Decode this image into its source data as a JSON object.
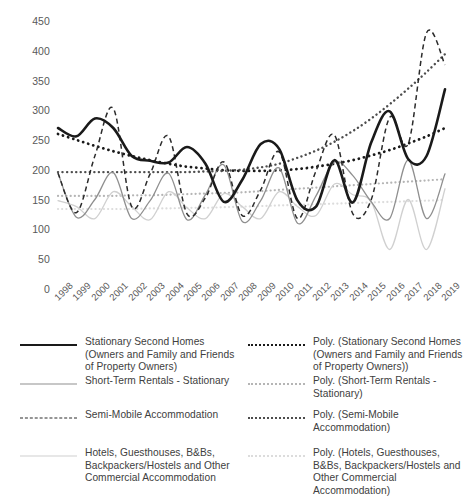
{
  "chart_data": {
    "type": "line",
    "title": "",
    "xlabel": "",
    "ylabel": "",
    "ylim": [
      0,
      450
    ],
    "ytick_step": 50,
    "yticks": [
      "450",
      "400",
      "350",
      "300",
      "250",
      "200",
      "150",
      "100",
      "50",
      "0"
    ],
    "grid": false,
    "legend_position": "bottom",
    "categories": [
      "1998",
      "1999",
      "2000",
      "2001",
      "2002",
      "2003",
      "2004",
      "2005",
      "2006",
      "2007",
      "2008",
      "2009",
      "2010",
      "2011",
      "2012",
      "2013",
      "2014",
      "2015",
      "2016",
      "2017",
      "2018",
      "2019"
    ],
    "series": [
      {
        "name": "Stationary Second Homes (Owners and Family and Friends of Property Owners)",
        "style": "solid",
        "color": "#1a1a1a",
        "width": 2.6,
        "values": [
          272,
          258,
          288,
          272,
          225,
          217,
          214,
          240,
          212,
          148,
          185,
          245,
          237,
          150,
          140,
          218,
          147,
          248,
          300,
          220,
          225,
          337
        ]
      },
      {
        "name": "Short-Term Rentals - Stationary",
        "style": "solid",
        "color": "#8f8f8f",
        "width": 1.3,
        "values": [
          196,
          122,
          152,
          197,
          120,
          150,
          196,
          118,
          160,
          210,
          115,
          150,
          205,
          112,
          158,
          215,
          192,
          148,
          120,
          218,
          120,
          195
        ]
      },
      {
        "name": "Semi-Mobile Accommodation",
        "style": "dashed",
        "color": "#2b2b2b",
        "width": 1.5,
        "values": [
          196,
          130,
          225,
          305,
          140,
          195,
          258,
          128,
          155,
          215,
          125,
          168,
          232,
          120,
          200,
          260,
          128,
          152,
          290,
          245,
          432,
          378
        ]
      },
      {
        "name": "Hotels, Guesthouses, B&Bs, Backpackers/Hostels and Other Commercial Accommodation",
        "style": "solid",
        "color": "#d0d0d0",
        "width": 1.3,
        "values": [
          150,
          140,
          120,
          165,
          140,
          118,
          165,
          138,
          120,
          162,
          140,
          120,
          165,
          140,
          125,
          178,
          160,
          148,
          68,
          152,
          68,
          170
        ]
      }
    ],
    "trendlines": [
      {
        "name": "Poly. (Stationary Second Homes (Owners and Family and Friends of Property Owners))",
        "style": "dotted",
        "color": "#1a1a1a",
        "width": 2.8,
        "values": [
          262,
          252,
          242,
          233,
          225,
          218,
          212,
          207,
          204,
          201,
          200,
          200,
          201,
          203,
          207,
          212,
          218,
          226,
          235,
          246,
          258,
          272
        ]
      },
      {
        "name": "Poly. (Short-Term Rentals - Stationary)",
        "style": "dotted",
        "color": "#b5b5b5",
        "width": 2.2,
        "values": [
          158,
          158,
          158,
          158,
          159,
          159,
          160,
          161,
          162,
          163,
          164,
          166,
          168,
          170,
          172,
          174,
          176,
          178,
          180,
          182,
          184,
          186
        ]
      },
      {
        "name": "Poly. (Semi-Mobile Accommodation)",
        "style": "dotted",
        "color": "#4d4d4d",
        "width": 2.4,
        "values": [
          198,
          198,
          198,
          198,
          198,
          198,
          198,
          198,
          199,
          200,
          202,
          206,
          212,
          222,
          234,
          249,
          267,
          288,
          312,
          338,
          366,
          396
        ]
      },
      {
        "name": "Poly. (Hotels, Guesthouses, B&Bs, Backpackers/Hostels and Other Commercial Accommodation)",
        "style": "dotted",
        "color": "#dcdcdc",
        "width": 2.2,
        "values": [
          136,
          136,
          136,
          136,
          136,
          137,
          137,
          138,
          138,
          139,
          140,
          141,
          142,
          143,
          144,
          145,
          146,
          147,
          148,
          149,
          150,
          151
        ]
      }
    ]
  },
  "legend": {
    "entries": [
      {
        "label": "Stationary Second Homes (Owners and Family and Friends of Property Owners)",
        "swatch": "solid-thick-black",
        "column": "left"
      },
      {
        "label": "Short-Term Rentals - Stationary",
        "swatch": "solid-gray",
        "column": "left"
      },
      {
        "label": "Semi-Mobile Accommodation",
        "swatch": "dashed-black",
        "column": "left"
      },
      {
        "label": "Hotels, Guesthouses, B&Bs, Backpackers/Hostels and Other Commercial Accommodation",
        "swatch": "solid-light-gray",
        "column": "left"
      },
      {
        "label": "Poly. (Stationary Second Homes (Owners and Family and Friends of Property Owners))",
        "swatch": "dotted-black",
        "column": "right"
      },
      {
        "label": "Poly. (Short-Term Rentals - Stationary)",
        "swatch": "dotted-gray",
        "column": "right"
      },
      {
        "label": "Poly. (Semi-Mobile Accommodation)",
        "swatch": "dotted-dark-gray",
        "column": "right"
      },
      {
        "label": "Poly. (Hotels, Guesthouses, B&Bs, Backpackers/Hostels and Other Commercial Accommodation)",
        "swatch": "dotted-light-gray",
        "column": "right"
      }
    ]
  },
  "colors": {
    "series_1": "#1a1a1a",
    "series_2": "#8f8f8f",
    "series_3": "#2b2b2b",
    "series_4": "#d0d0d0",
    "axis_text": "#595959",
    "background": "#ffffff"
  }
}
